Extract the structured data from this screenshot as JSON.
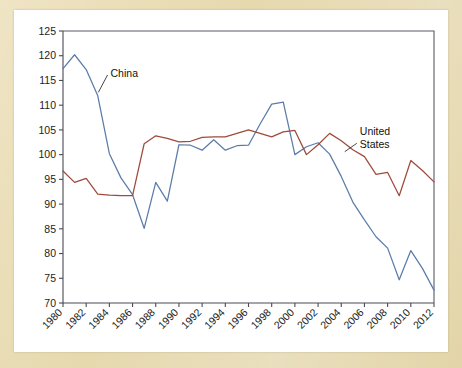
{
  "chart_data": {
    "type": "line",
    "title": "",
    "subtitle": "",
    "xlabel": "",
    "ylabel": "",
    "xlim": [
      1980,
      2012
    ],
    "ylim": [
      70,
      125
    ],
    "grid": false,
    "legend_position": "inline-annotations",
    "y_ticks": [
      70,
      75,
      80,
      85,
      90,
      95,
      100,
      105,
      110,
      115,
      120,
      125
    ],
    "x_ticks": [
      1980,
      1982,
      1984,
      1986,
      1988,
      1990,
      1992,
      1994,
      1996,
      1998,
      2000,
      2002,
      2004,
      2006,
      2008,
      2010,
      2012
    ],
    "x_tick_labels": [
      "1980",
      "1982",
      "1984",
      "1986",
      "1988",
      "1990",
      "1992",
      "1994",
      "1996",
      "1998",
      "2000",
      "2002",
      "2004",
      "2006",
      "2008",
      "2010",
      "2012"
    ],
    "y_tick_labels": [
      "70",
      "75",
      "80",
      "85",
      "90",
      "95",
      "100",
      "105",
      "110",
      "115",
      "120",
      "125"
    ],
    "x": [
      1980,
      1981,
      1982,
      1983,
      1984,
      1985,
      1986,
      1987,
      1988,
      1989,
      1990,
      1991,
      1992,
      1993,
      1994,
      1995,
      1996,
      1997,
      1998,
      1999,
      2000,
      2001,
      2002,
      2003,
      2004,
      2005,
      2006,
      2007,
      2008,
      2009,
      2010,
      2011,
      2012
    ],
    "series": [
      {
        "name": "China",
        "color": "#5b7ca8",
        "values": [
          117.4,
          120.2,
          117.2,
          111.9,
          100.2,
          95.3,
          91.9,
          85.1,
          94.4,
          90.6,
          102.0,
          101.9,
          100.9,
          103.0,
          100.9,
          101.8,
          101.9,
          106.2,
          110.2,
          110.6,
          100.0,
          101.6,
          102.4,
          100.1,
          95.6,
          90.4,
          86.8,
          83.4,
          81.1,
          74.7,
          80.6,
          77.0,
          72.6
        ]
      },
      {
        "name": "United States",
        "color": "#9e4a3c",
        "values": [
          96.7,
          94.4,
          95.2,
          92.0,
          91.8,
          91.7,
          91.7,
          102.2,
          103.8,
          103.3,
          102.6,
          102.7,
          103.5,
          103.6,
          103.6,
          104.3,
          105.0,
          104.3,
          103.6,
          104.6,
          104.9,
          100.0,
          102.0,
          104.3,
          102.8,
          101.0,
          99.6,
          96.0,
          96.4,
          91.7,
          98.8,
          96.8,
          94.5
        ]
      }
    ],
    "annotations": [
      {
        "label": "China",
        "lines": [
          "China"
        ],
        "color": "#111111"
      },
      {
        "label": "United States",
        "lines": [
          "United",
          "States"
        ],
        "color": "#111111"
      }
    ]
  },
  "colors": {
    "china_line": "#5b7ca8",
    "us_line": "#9e4a3c",
    "page_background": "#e8dcb5",
    "card_background": "#ffffff",
    "axis": "#4a4a55",
    "text": "#111111"
  }
}
